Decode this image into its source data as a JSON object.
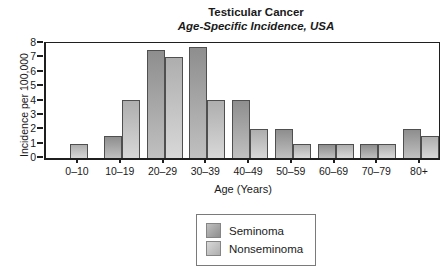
{
  "title": "Testicular Cancer",
  "subtitle": "Age-Specific Incidence, USA",
  "chart_data": {
    "type": "bar",
    "title": "Testicular Cancer",
    "subtitle": "Age-Specific Incidence, USA",
    "categories": [
      "0–10",
      "10–19",
      "20–29",
      "30–39",
      "40–49",
      "50–59",
      "60–69",
      "70–79",
      "80+"
    ],
    "series": [
      {
        "name": "Seminoma",
        "values": [
          0,
          1.5,
          7.5,
          7.7,
          4,
          2,
          1,
          1,
          2
        ],
        "color_top": "#8e8e8e",
        "color_bottom": "#c0c0c0"
      },
      {
        "name": "Nonseminoma",
        "values": [
          1,
          4,
          7,
          4,
          2,
          1,
          1,
          1,
          1.5
        ],
        "color_top": "#aeaeae",
        "color_bottom": "#d8d8d8"
      }
    ],
    "xlabel": "Age (Years)",
    "ylabel": "Incidence per 100,000",
    "ylim": [
      0,
      8
    ],
    "yticks": [
      0,
      1,
      2,
      3,
      4,
      5,
      6,
      7,
      8
    ],
    "grid": false,
    "legend_position": "bottom-center",
    "bar_border_color": "#4f4f4f",
    "axis_color": "#1f1f1f"
  }
}
